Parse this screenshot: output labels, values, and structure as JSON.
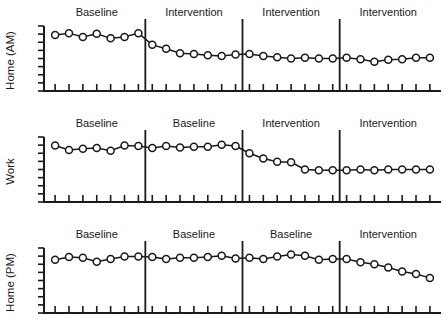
{
  "figure": {
    "type": "multiple-baseline-single-case-design",
    "background_color": "#ffffff",
    "ink_color": "#1a1a1a",
    "marker_fill": "#ffffff"
  },
  "chart_data": {
    "type": "line",
    "title": "",
    "xlabel": "",
    "ylabel": "",
    "grid": false,
    "legend": "none",
    "marker": "open-circle",
    "axis_tick_labels_shown": false,
    "y_tick_count": 9,
    "ylim": [
      0,
      10
    ],
    "points_per_phase": 7,
    "x": [
      1,
      2,
      3,
      4,
      5,
      6,
      7,
      8,
      9,
      10,
      11,
      12,
      13,
      14,
      15,
      16,
      17,
      18,
      19,
      20,
      21,
      22,
      23,
      24,
      25,
      26,
      27,
      28
    ],
    "panels": [
      {
        "name": "home-am",
        "ylabel": "Home (AM)",
        "phases": [
          {
            "label": "Baseline",
            "x": [
              1,
              2,
              3,
              4,
              5,
              6,
              7
            ],
            "values": [
              8.6,
              8.9,
              8.3,
              8.8,
              8.1,
              8.3,
              8.9
            ]
          },
          {
            "label": "Intervention",
            "x": [
              8,
              9,
              10,
              11,
              12,
              13,
              14
            ],
            "values": [
              7.1,
              6.5,
              5.8,
              5.7,
              5.5,
              5.4,
              5.6
            ]
          },
          {
            "label": "Intervention",
            "x": [
              15,
              16,
              17,
              18,
              19,
              20,
              21
            ],
            "values": [
              5.7,
              5.4,
              5.2,
              5.0,
              5.1,
              5.0,
              5.0
            ]
          },
          {
            "label": "Intervention",
            "x": [
              22,
              23,
              24,
              25,
              26,
              27,
              28
            ],
            "values": [
              5.1,
              4.9,
              4.5,
              4.8,
              4.9,
              5.1,
              5.1
            ]
          }
        ]
      },
      {
        "name": "work",
        "ylabel": "Work",
        "phases": [
          {
            "label": "Baseline",
            "x": [
              1,
              2,
              3,
              4,
              5,
              6,
              7
            ],
            "values": [
              8.7,
              8.0,
              8.2,
              8.3,
              7.9,
              8.7,
              8.6
            ]
          },
          {
            "label": "Baseline",
            "x": [
              8,
              9,
              10,
              11,
              12,
              13,
              14
            ],
            "values": [
              8.3,
              8.6,
              8.4,
              8.5,
              8.5,
              8.8,
              8.6
            ]
          },
          {
            "label": "Intervention",
            "x": [
              15,
              16,
              17,
              18,
              19,
              20,
              21
            ],
            "values": [
              7.5,
              6.7,
              6.2,
              6.1,
              5.0,
              4.9,
              4.9
            ]
          },
          {
            "label": "Intervention",
            "x": [
              22,
              23,
              24,
              25,
              26,
              27,
              28
            ],
            "values": [
              4.9,
              5.0,
              4.9,
              5.0,
              5.0,
              5.0,
              5.0
            ]
          }
        ]
      },
      {
        "name": "home-pm",
        "ylabel": "Home (PM)",
        "phases": [
          {
            "label": "Baseline",
            "x": [
              1,
              2,
              3,
              4,
              5,
              6,
              7
            ],
            "values": [
              8.2,
              8.6,
              8.5,
              7.9,
              8.3,
              8.7,
              8.7
            ]
          },
          {
            "label": "Baseline",
            "x": [
              8,
              9,
              10,
              11,
              12,
              13,
              14
            ],
            "values": [
              8.6,
              8.3,
              8.5,
              8.5,
              8.6,
              8.8,
              8.4
            ]
          },
          {
            "label": "Baseline",
            "x": [
              15,
              16,
              17,
              18,
              19,
              20,
              21
            ],
            "values": [
              8.5,
              8.3,
              8.7,
              9.0,
              8.8,
              8.2,
              8.3
            ]
          },
          {
            "label": "Intervention",
            "x": [
              22,
              23,
              24,
              25,
              26,
              27,
              28
            ],
            "values": [
              8.3,
              7.8,
              7.5,
              7.0,
              6.4,
              6.0,
              5.4
            ]
          }
        ]
      }
    ]
  }
}
